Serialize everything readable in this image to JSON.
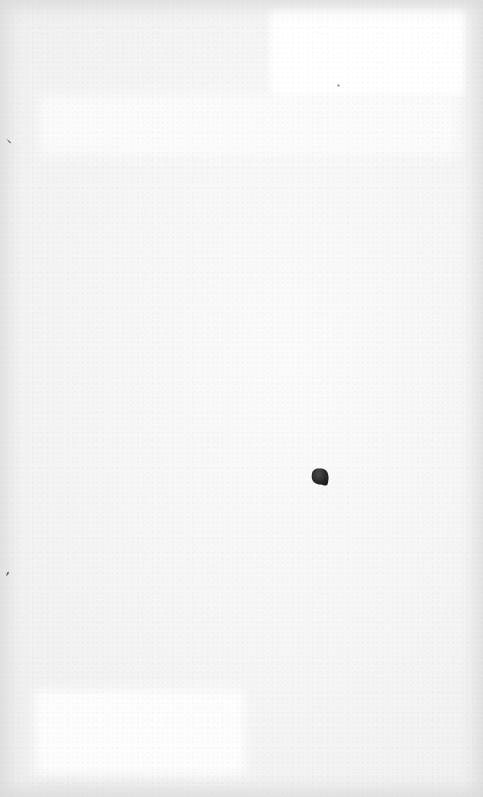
{
  "image": {
    "description": "Close-up of an off-white textured paper-like surface with a small dark pebble and a few tiny dark specks",
    "background_color": "#f3f3f3",
    "highlight_color": "#ffffff",
    "objects": [
      {
        "name": "dark-pebble",
        "color": "#2e2e2e",
        "center": [
          319,
          477
        ],
        "approx_size": [
          20,
          20
        ]
      },
      {
        "name": "left-edge-mark-top",
        "color": "#555555",
        "center": [
          8,
          141
        ]
      },
      {
        "name": "left-edge-mark-bottom",
        "color": "#444444",
        "center": [
          7,
          574
        ]
      },
      {
        "name": "small-dot-top",
        "color": "#9a9a9a",
        "center": [
          338,
          85
        ]
      }
    ]
  }
}
